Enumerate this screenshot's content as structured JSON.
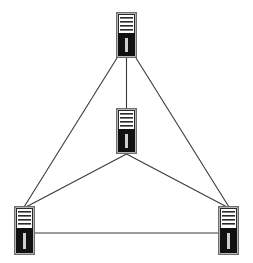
{
  "diagram": {
    "type": "network-topology",
    "colors": {
      "background": "#ffffff",
      "line": "#3a3a3a",
      "server_frame": "#6e6e6e",
      "server_face": "#ffffff",
      "server_bars": "#2a2a2a",
      "server_base": "#111111",
      "server_slot": "#cfcfcf"
    },
    "nodes": [
      {
        "id": "server-top",
        "icon": "server-tower-icon",
        "x": 116,
        "y": 12,
        "w": 21,
        "h": 46
      },
      {
        "id": "server-center",
        "icon": "server-tower-icon",
        "x": 116,
        "y": 108,
        "w": 21,
        "h": 46
      },
      {
        "id": "server-bottom-left",
        "icon": "server-tower-icon",
        "x": 14,
        "y": 206,
        "w": 21,
        "h": 49
      },
      {
        "id": "server-bottom-right",
        "icon": "server-tower-icon",
        "x": 218,
        "y": 206,
        "w": 21,
        "h": 49
      }
    ],
    "edges": [
      {
        "from": "server-top",
        "to": "server-center",
        "x1": 126.5,
        "y1": 58,
        "x2": 126.5,
        "y2": 108
      },
      {
        "from": "server-top",
        "to": "server-bottom-left",
        "x1": 117,
        "y1": 58,
        "x2": 24,
        "y2": 207
      },
      {
        "from": "server-top",
        "to": "server-bottom-right",
        "x1": 136,
        "y1": 58,
        "x2": 229,
        "y2": 207
      },
      {
        "from": "server-center",
        "to": "server-bottom-left",
        "x1": 126.5,
        "y1": 154,
        "x2": 26,
        "y2": 207
      },
      {
        "from": "server-center",
        "to": "server-bottom-right",
        "x1": 126.5,
        "y1": 154,
        "x2": 227,
        "y2": 207
      },
      {
        "from": "server-bottom-left",
        "to": "server-bottom-right",
        "x1": 35,
        "y1": 233,
        "x2": 218,
        "y2": 233
      }
    ]
  }
}
